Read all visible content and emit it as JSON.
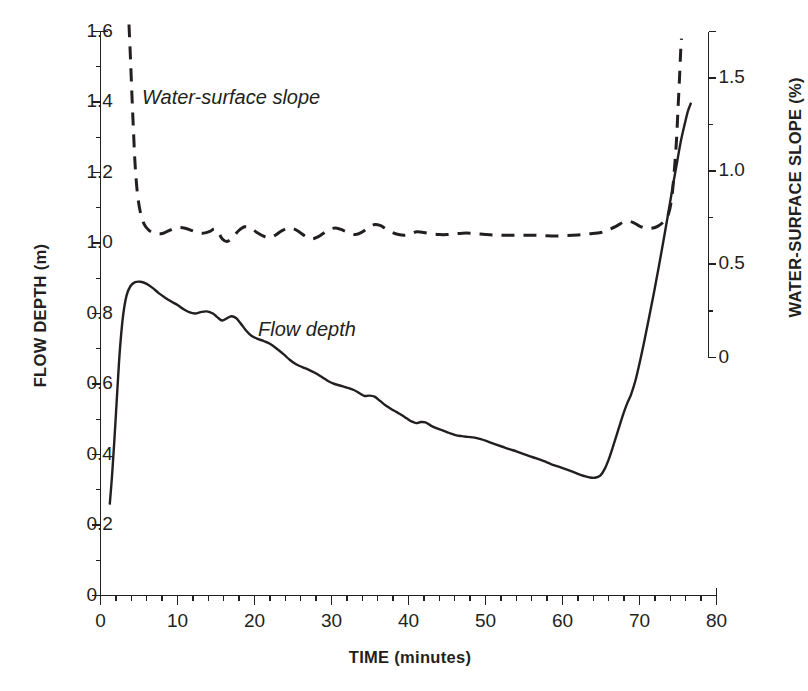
{
  "chart_data": {
    "type": "line",
    "title": "",
    "xlabel": "TIME (minutes)",
    "ylabel": "FLOW DEPTH (m)",
    "y2label": "WATER-SURFACE SLOPE (%)",
    "xlim": [
      0,
      80
    ],
    "ylim": [
      0,
      1.6
    ],
    "y2lim": [
      0,
      1.75
    ],
    "xticks": [
      0,
      10,
      20,
      30,
      40,
      50,
      60,
      70,
      80
    ],
    "xtick_labels": [
      "0",
      "10",
      "20",
      "30",
      "40",
      "50",
      "60",
      "70",
      "80"
    ],
    "xminor_step": 2,
    "yticks": [
      0,
      0.2,
      0.4,
      0.6,
      0.8,
      1.0,
      1.2,
      1.4,
      1.6
    ],
    "ytick_labels": [
      "0",
      "0.2",
      "0.4",
      "0.6",
      "0.8",
      "1.0",
      "1.2",
      "1.4",
      "1.6"
    ],
    "yminor_step": 0.1,
    "y2ticks": [
      0,
      0.5,
      1.0,
      1.5
    ],
    "y2tick_labels": [
      "0",
      "0.5",
      "1.0",
      "1.5"
    ],
    "y2minor_step": 0.25,
    "grid": false,
    "legend": "inline-annotations",
    "annotations": [
      {
        "text": "Water-surface slope",
        "x": 6.0,
        "y": 1.44,
        "style": "italic"
      },
      {
        "text": "Flow depth",
        "x": 21.5,
        "y": 0.735,
        "style": "italic"
      }
    ],
    "series": [
      {
        "name": "Flow depth",
        "axis": "left",
        "unit": "m",
        "style": "solid",
        "color": "#231f20",
        "points": [
          [
            1.2,
            0.258
          ],
          [
            1.5,
            0.34
          ],
          [
            1.8,
            0.44
          ],
          [
            2.1,
            0.55
          ],
          [
            2.4,
            0.66
          ],
          [
            2.7,
            0.745
          ],
          [
            3.0,
            0.805
          ],
          [
            3.4,
            0.852
          ],
          [
            3.9,
            0.878
          ],
          [
            4.5,
            0.889
          ],
          [
            5.2,
            0.89
          ],
          [
            6.0,
            0.884
          ],
          [
            6.8,
            0.872
          ],
          [
            7.6,
            0.857
          ],
          [
            8.4,
            0.845
          ],
          [
            9.2,
            0.834
          ],
          [
            10.0,
            0.824
          ],
          [
            10.8,
            0.812
          ],
          [
            11.6,
            0.803
          ],
          [
            12.3,
            0.8
          ],
          [
            13.0,
            0.804
          ],
          [
            13.8,
            0.806
          ],
          [
            14.6,
            0.8
          ],
          [
            15.2,
            0.789
          ],
          [
            15.8,
            0.78
          ],
          [
            16.4,
            0.786
          ],
          [
            17.0,
            0.792
          ],
          [
            17.6,
            0.787
          ],
          [
            18.2,
            0.772
          ],
          [
            18.9,
            0.752
          ],
          [
            19.6,
            0.737
          ],
          [
            20.4,
            0.728
          ],
          [
            21.2,
            0.722
          ],
          [
            22.0,
            0.714
          ],
          [
            22.9,
            0.7
          ],
          [
            23.8,
            0.684
          ],
          [
            24.6,
            0.668
          ],
          [
            25.4,
            0.656
          ],
          [
            26.2,
            0.648
          ],
          [
            27.0,
            0.641
          ],
          [
            27.9,
            0.631
          ],
          [
            28.8,
            0.619
          ],
          [
            29.6,
            0.608
          ],
          [
            30.4,
            0.6
          ],
          [
            31.2,
            0.595
          ],
          [
            32.0,
            0.59
          ],
          [
            32.9,
            0.583
          ],
          [
            33.7,
            0.573
          ],
          [
            34.3,
            0.566
          ],
          [
            34.9,
            0.567
          ],
          [
            35.6,
            0.564
          ],
          [
            36.3,
            0.552
          ],
          [
            37.0,
            0.54
          ],
          [
            37.7,
            0.53
          ],
          [
            38.4,
            0.521
          ],
          [
            39.1,
            0.512
          ],
          [
            39.8,
            0.502
          ],
          [
            40.4,
            0.494
          ],
          [
            41.0,
            0.489
          ],
          [
            41.6,
            0.492
          ],
          [
            42.2,
            0.491
          ],
          [
            42.9,
            0.482
          ],
          [
            43.7,
            0.474
          ],
          [
            44.5,
            0.468
          ],
          [
            45.3,
            0.461
          ],
          [
            46.1,
            0.455
          ],
          [
            46.9,
            0.452
          ],
          [
            47.7,
            0.45
          ],
          [
            48.6,
            0.448
          ],
          [
            49.5,
            0.443
          ],
          [
            50.4,
            0.436
          ],
          [
            51.3,
            0.429
          ],
          [
            52.2,
            0.422
          ],
          [
            53.1,
            0.415
          ],
          [
            54.0,
            0.409
          ],
          [
            54.9,
            0.402
          ],
          [
            55.8,
            0.395
          ],
          [
            56.7,
            0.388
          ],
          [
            57.6,
            0.381
          ],
          [
            58.5,
            0.373
          ],
          [
            59.4,
            0.366
          ],
          [
            60.3,
            0.359
          ],
          [
            61.2,
            0.352
          ],
          [
            62.0,
            0.345
          ],
          [
            62.8,
            0.339
          ],
          [
            63.5,
            0.335
          ],
          [
            64.2,
            0.334
          ],
          [
            64.9,
            0.34
          ],
          [
            65.5,
            0.36
          ],
          [
            66.1,
            0.392
          ],
          [
            66.7,
            0.432
          ],
          [
            67.3,
            0.474
          ],
          [
            67.9,
            0.515
          ],
          [
            68.4,
            0.545
          ],
          [
            68.9,
            0.57
          ],
          [
            69.5,
            0.612
          ],
          [
            70.1,
            0.668
          ],
          [
            70.7,
            0.73
          ],
          [
            71.3,
            0.795
          ],
          [
            71.9,
            0.862
          ],
          [
            72.5,
            0.932
          ],
          [
            73.1,
            1.005
          ],
          [
            73.7,
            1.08
          ],
          [
            74.3,
            1.158
          ],
          [
            74.9,
            1.232
          ],
          [
            75.4,
            1.292
          ],
          [
            75.9,
            1.34
          ],
          [
            76.3,
            1.375
          ],
          [
            76.7,
            1.398
          ]
        ]
      },
      {
        "name": "Water-surface slope",
        "axis": "right",
        "unit": "%",
        "style": "dashed",
        "color": "#231f20",
        "points_left_scale": [
          [
            3.7,
            1.62
          ],
          [
            3.9,
            1.52
          ],
          [
            4.1,
            1.41
          ],
          [
            4.3,
            1.31
          ],
          [
            4.5,
            1.22
          ],
          [
            4.8,
            1.14
          ],
          [
            5.2,
            1.085
          ],
          [
            5.7,
            1.052
          ],
          [
            6.3,
            1.036
          ],
          [
            7.0,
            1.028
          ],
          [
            7.8,
            1.026
          ],
          [
            8.6,
            1.032
          ],
          [
            9.4,
            1.04
          ],
          [
            10.2,
            1.044
          ],
          [
            11.0,
            1.042
          ],
          [
            11.8,
            1.036
          ],
          [
            12.6,
            1.03
          ],
          [
            13.4,
            1.028
          ],
          [
            14.2,
            1.033
          ],
          [
            14.8,
            1.04
          ],
          [
            15.3,
            1.03
          ],
          [
            15.8,
            1.012
          ],
          [
            16.4,
            1.004
          ],
          [
            17.1,
            1.014
          ],
          [
            17.9,
            1.034
          ],
          [
            18.7,
            1.046
          ],
          [
            19.5,
            1.042
          ],
          [
            20.3,
            1.03
          ],
          [
            21.1,
            1.02
          ],
          [
            21.9,
            1.015
          ],
          [
            22.7,
            1.022
          ],
          [
            23.5,
            1.034
          ],
          [
            24.3,
            1.042
          ],
          [
            25.1,
            1.04
          ],
          [
            25.9,
            1.03
          ],
          [
            26.7,
            1.018
          ],
          [
            27.5,
            1.012
          ],
          [
            28.3,
            1.018
          ],
          [
            29.1,
            1.03
          ],
          [
            29.9,
            1.04
          ],
          [
            30.7,
            1.042
          ],
          [
            31.5,
            1.036
          ],
          [
            32.3,
            1.028
          ],
          [
            33.1,
            1.024
          ],
          [
            33.9,
            1.03
          ],
          [
            34.7,
            1.042
          ],
          [
            35.5,
            1.052
          ],
          [
            36.3,
            1.05
          ],
          [
            37.1,
            1.04
          ],
          [
            37.9,
            1.03
          ],
          [
            38.7,
            1.024
          ],
          [
            39.5,
            1.022
          ],
          [
            40.3,
            1.026
          ],
          [
            41.1,
            1.032
          ],
          [
            42.0,
            1.03
          ],
          [
            43.0,
            1.026
          ],
          [
            44.0,
            1.024
          ],
          [
            45.0,
            1.024
          ],
          [
            46.0,
            1.026
          ],
          [
            47.0,
            1.028
          ],
          [
            48.0,
            1.028
          ],
          [
            49.0,
            1.026
          ],
          [
            50.0,
            1.024
          ],
          [
            51.5,
            1.022
          ],
          [
            53.0,
            1.022
          ],
          [
            54.5,
            1.022
          ],
          [
            56.0,
            1.022
          ],
          [
            57.5,
            1.021
          ],
          [
            59.0,
            1.02
          ],
          [
            60.5,
            1.021
          ],
          [
            62.0,
            1.023
          ],
          [
            63.5,
            1.026
          ],
          [
            65.0,
            1.03
          ],
          [
            66.0,
            1.038
          ],
          [
            67.0,
            1.048
          ],
          [
            67.8,
            1.058
          ],
          [
            68.5,
            1.062
          ],
          [
            69.2,
            1.058
          ],
          [
            70.0,
            1.048
          ],
          [
            70.8,
            1.042
          ],
          [
            71.6,
            1.042
          ],
          [
            72.4,
            1.048
          ],
          [
            73.2,
            1.062
          ],
          [
            73.8,
            1.085
          ],
          [
            74.2,
            1.13
          ],
          [
            74.5,
            1.2
          ],
          [
            74.8,
            1.29
          ],
          [
            75.0,
            1.38
          ],
          [
            75.2,
            1.47
          ],
          [
            75.35,
            1.545
          ],
          [
            75.45,
            1.58
          ]
        ]
      }
    ]
  },
  "axes": {
    "left_title": "FLOW DEPTH (m)",
    "right_title": "WATER-SURFACE SLOPE (%)",
    "bottom_title": "TIME (minutes)"
  },
  "colors": {
    "ink": "#231f20",
    "background": "#ffffff"
  }
}
